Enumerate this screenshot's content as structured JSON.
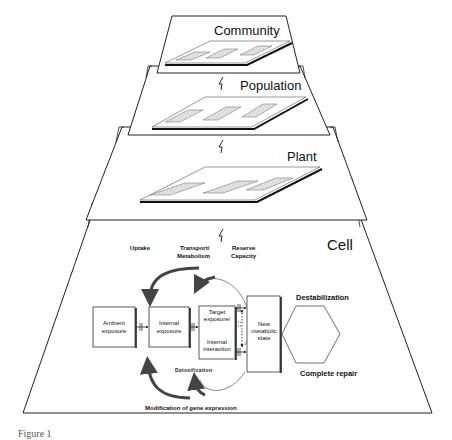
{
  "levels": [
    {
      "label": "Community"
    },
    {
      "label": "Population"
    },
    {
      "label": "Plant"
    },
    {
      "label": "Cell"
    }
  ],
  "cell": {
    "top_labels": {
      "uptake": "Uptake",
      "transport_1": "Transport/",
      "transport_2": "Metabolism",
      "reserve_1": "Reserve",
      "reserve_2": "Capacity"
    },
    "boxes": {
      "ambient_1": "Ambient",
      "ambient_2": "exposure",
      "internal_1": "Internal",
      "internal_2": "exposure",
      "target_1": "Target",
      "target_2": "exposure/",
      "interaction_1": "Internal",
      "interaction_2": "interaction",
      "new_1": "New",
      "new_2": "metabolic",
      "new_3": "state"
    },
    "destabilization": "Destabilization",
    "complete_repair": "Complete repair",
    "detoxification": "Detoxification",
    "gene_expression": "Modification of gene expression"
  },
  "caption": "Figure 1"
}
